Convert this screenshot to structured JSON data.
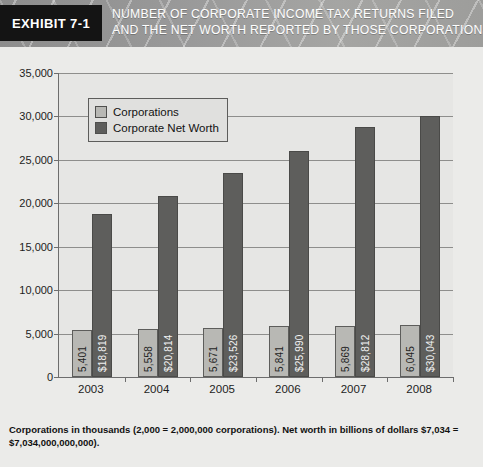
{
  "header": {
    "exhibit_label": "EXHIBIT 7-1",
    "title_line_1": "NUMBER OF CORPORATE INCOME TAX RETURNS FILED",
    "title_line_2": "AND THE NET WORTH REPORTED BY THOSE CORPORATIONS"
  },
  "footnote": {
    "line_1": "Corporations in thousands (2,000 = 2,000,000 corporations). Net worth in billions of dollars $7,034 =",
    "line_2": "$7,034,000,000,000)."
  },
  "colors": {
    "series_corporations": "#b8b8b4",
    "series_net_worth": "#5e5e5c",
    "plot_background": "#e6e6e4",
    "page_background": "#ebebe9",
    "axis": "#6d6d6d",
    "exhibit_box": "#141414"
  },
  "chart_data": {
    "type": "bar",
    "title": "NUMBER OF CORPORATE INCOME TAX RETURNS FILED AND THE NET WORTH REPORTED BY THOSE CORPORATIONS",
    "xlabel": "",
    "ylabel": "",
    "categories": [
      "2003",
      "2004",
      "2005",
      "2006",
      "2007",
      "2008"
    ],
    "ylim": [
      0,
      35000
    ],
    "ytick_values": [
      0,
      5000,
      10000,
      15000,
      20000,
      25000,
      30000,
      35000
    ],
    "ytick_labels": [
      "0",
      "5,000",
      "10,000",
      "15,000",
      "20,000",
      "25,000",
      "30,000",
      "35,000"
    ],
    "grid": true,
    "legend_position": "upper-left-inside",
    "series": [
      {
        "name": "Corporations",
        "color": "#b8b8b4",
        "values": [
          5401,
          5558,
          5671,
          5841,
          5869,
          6045
        ],
        "data_labels": [
          "5,401",
          "5,558",
          "5,671",
          "5,841",
          "5,869",
          "6,045"
        ]
      },
      {
        "name": "Corporate Net Worth",
        "color": "#5e5e5c",
        "values": [
          18819,
          20814,
          23526,
          25990,
          28812,
          30043
        ],
        "data_labels": [
          "$18,819",
          "$20,814",
          "$23,526",
          "$25,990",
          "$28,812",
          "$30,043"
        ]
      }
    ]
  }
}
